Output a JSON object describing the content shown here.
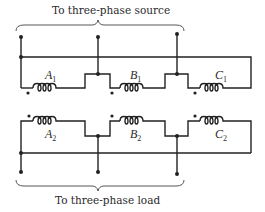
{
  "diagram": {
    "title_top": "To three-phase source",
    "title_bottom": "To three-phase load",
    "upper_coils": [
      {
        "letter": "A",
        "sub": "1"
      },
      {
        "letter": "B",
        "sub": "1"
      },
      {
        "letter": "C",
        "sub": "1"
      }
    ],
    "lower_coils": [
      {
        "letter": "A",
        "sub": "2"
      },
      {
        "letter": "B",
        "sub": "2"
      },
      {
        "letter": "C",
        "sub": "2"
      }
    ],
    "colors": {
      "line": "#222222",
      "background": "#ffffff"
    }
  }
}
